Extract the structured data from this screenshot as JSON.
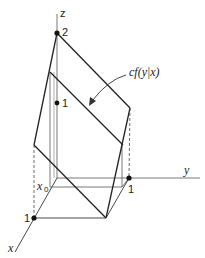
{
  "diagram": {
    "axes": {
      "z_label": "z",
      "y_label": "y",
      "x_label": "x"
    },
    "ticks": {
      "z_two": "2",
      "z_one": "1",
      "y_one": "1",
      "x_one": "1"
    },
    "x0_label": "x",
    "x0_sub": "0",
    "annotation": "cf(y|x)",
    "colors": {
      "line": "#222222",
      "thin": "#555555",
      "background": "#ffffff"
    }
  }
}
